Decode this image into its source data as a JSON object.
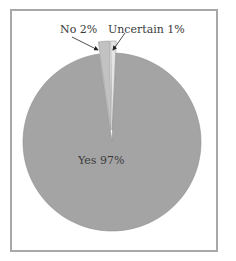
{
  "chart_data": {
    "type": "pie",
    "title": "",
    "categories": [
      "Yes",
      "No",
      "Uncertain"
    ],
    "values": [
      97,
      2,
      1
    ],
    "labels": [
      "Yes 97%",
      "No 2%",
      "Uncertain 1%"
    ],
    "colors": {
      "Yes": "#a4a4a4",
      "No": "#c2c2c2",
      "Uncertain": "#e4e4e4"
    },
    "exploded": [
      "No",
      "Uncertain"
    ],
    "legend": "none",
    "annotations": [
      "No 2% (arrow to slice)",
      "Uncertain 1% (arrow to slice)"
    ]
  },
  "labels": {
    "yes": "Yes  97%",
    "no": "No  2%",
    "uncertain": "Uncertain  1%"
  }
}
